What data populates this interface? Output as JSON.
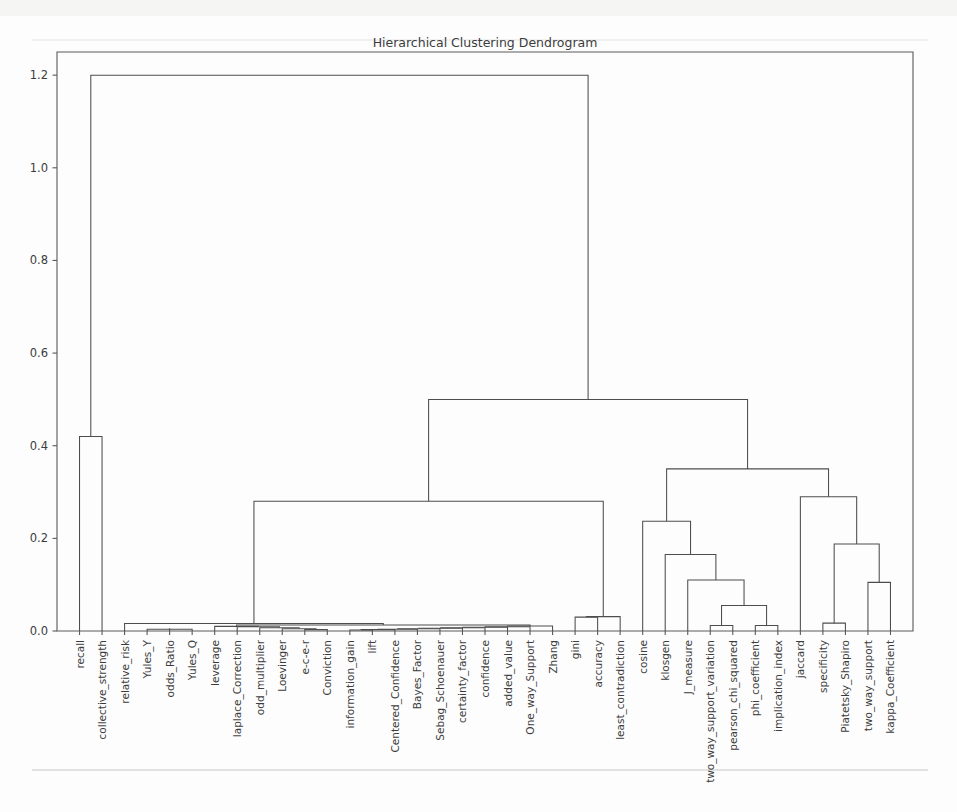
{
  "figure": {
    "title": "Hierarchical Clustering Dendrogram",
    "width": 957,
    "height": 812,
    "background_color": "#fdfdfd",
    "line_color": "#4d4d4d",
    "axis_color": "#5a5a5a",
    "text_color": "#3c3c3c"
  },
  "axes": {
    "left_px": 57,
    "right_px": 913,
    "top_px": 52,
    "bottom_px": 631,
    "y_label": "",
    "x_label": "",
    "grid": false,
    "y_ticks": [
      "0.0",
      "0.2",
      "0.4",
      "0.6",
      "0.8",
      "1.0",
      "1.2"
    ],
    "y_tick_values": [
      0.0,
      0.2,
      0.4,
      0.6,
      0.8,
      1.0,
      1.2
    ]
  },
  "chart_data": {
    "type": "dendrogram",
    "title": "Hierarchical Clustering Dendrogram",
    "xlabel": "",
    "ylabel": "",
    "ylim": [
      0.0,
      1.25
    ],
    "grid": false,
    "legend": "none",
    "orientation": "top",
    "leaf_labels": [
      "recall",
      "collective_strength",
      "relative_risk",
      "Yules_Y",
      "odds_Ratio",
      "Yules_Q",
      "leverage",
      "laplace_Correction",
      "odd_multiplier",
      "Loevinger",
      "e-c-e-r",
      "Conviction",
      "information_gain",
      "lift",
      "Centered_Confidence",
      "Bayes_Factor",
      "Sebag_Schoenauer",
      "certainty_factor",
      "confidence",
      "added_value",
      "One_way_Support",
      "Zhang",
      "gini",
      "accuracy",
      "least_contradiction",
      "cosine",
      "klosgen",
      "J_measure",
      "two_way_support_variation",
      "pearson_chi_squared",
      "phi_coefficient",
      "implication_index",
      "jaccard",
      "specificity",
      "Piatetsky_Shapiro",
      "two_way_support",
      "kappa_Coefficient"
    ],
    "leaf_count": 37,
    "merges": [
      {
        "id": 37,
        "left": 3,
        "right": 5,
        "height": 0.004,
        "note": "Yules_Y + Yules_Q"
      },
      {
        "id": 38,
        "left": 4,
        "right": 37,
        "height": 0.006,
        "note": "odds_Ratio + (Yules_Y,Yules_Q)"
      },
      {
        "id": 39,
        "left": 10,
        "right": 11,
        "height": 0.003,
        "note": "e-c-e-r + Conviction"
      },
      {
        "id": 40,
        "left": 9,
        "right": 39,
        "height": 0.005,
        "note": "Loevinger + (e-c-e-r,Conviction)"
      },
      {
        "id": 41,
        "left": 8,
        "right": 40,
        "height": 0.007,
        "note": "odd_multiplier + cluster"
      },
      {
        "id": 42,
        "left": 7,
        "right": 41,
        "height": 0.009,
        "note": "laplace_Correction + cluster"
      },
      {
        "id": 43,
        "left": 6,
        "right": 42,
        "height": 0.01,
        "note": "leverage + cluster"
      },
      {
        "id": 44,
        "left": 12,
        "right": 13,
        "height": 0.002,
        "note": "information_gain + lift"
      },
      {
        "id": 45,
        "left": 14,
        "right": 44,
        "height": 0.003,
        "note": "Centered_Confidence + cluster"
      },
      {
        "id": 46,
        "left": 15,
        "right": 45,
        "height": 0.004,
        "note": "Bayes_Factor + cluster"
      },
      {
        "id": 47,
        "left": 16,
        "right": 46,
        "height": 0.005,
        "note": "Sebag_Schoenauer + cluster"
      },
      {
        "id": 48,
        "left": 17,
        "right": 47,
        "height": 0.006,
        "note": "certainty_factor + cluster"
      },
      {
        "id": 49,
        "left": 18,
        "right": 48,
        "height": 0.007,
        "note": "confidence + cluster"
      },
      {
        "id": 50,
        "left": 19,
        "right": 49,
        "height": 0.008,
        "note": "added_value + cluster"
      },
      {
        "id": 51,
        "left": 20,
        "right": 50,
        "height": 0.009,
        "note": "One_way_Support + cluster"
      },
      {
        "id": 52,
        "left": 21,
        "right": 51,
        "height": 0.011,
        "note": "Zhang + cluster"
      },
      {
        "id": 53,
        "left": 43,
        "right": 52,
        "height": 0.013,
        "note": "merge mid clusters"
      },
      {
        "id": 54,
        "left": 2,
        "right": 53,
        "height": 0.016,
        "note": "relative_risk + big low cluster"
      },
      {
        "id": 55,
        "left": 22,
        "right": 23,
        "height": 0.03,
        "note": "gini + accuracy"
      },
      {
        "id": 56,
        "left": 24,
        "right": 55,
        "height": 0.031,
        "note": "least_contradiction + (gini,accuracy)"
      },
      {
        "id": 57,
        "left": 54,
        "right": 56,
        "height": 0.28,
        "note": "left major cluster"
      },
      {
        "id": 58,
        "left": 0,
        "right": 1,
        "height": 0.42,
        "note": "recall + collective_strength"
      },
      {
        "id": 59,
        "left": 28,
        "right": 29,
        "height": 0.012,
        "note": "two_way_support_variation + pearson_chi_squared"
      },
      {
        "id": 60,
        "left": 30,
        "right": 31,
        "height": 0.012,
        "note": "phi_coefficient + implication_index"
      },
      {
        "id": 61,
        "left": 59,
        "right": 60,
        "height": 0.055,
        "note": "chi cluster"
      },
      {
        "id": 62,
        "left": 27,
        "right": 61,
        "height": 0.11,
        "note": "J_measure + chi cluster"
      },
      {
        "id": 63,
        "left": 26,
        "right": 62,
        "height": 0.165,
        "note": "klosgen + cluster"
      },
      {
        "id": 64,
        "left": 25,
        "right": 63,
        "height": 0.237,
        "note": "cosine + cluster"
      },
      {
        "id": 65,
        "left": 33,
        "right": 34,
        "height": 0.017,
        "note": "specificity + Piatetsky_Shapiro"
      },
      {
        "id": 66,
        "left": 35,
        "right": 36,
        "height": 0.105,
        "note": "two_way_support + kappa_Coefficient"
      },
      {
        "id": 67,
        "left": 65,
        "right": 66,
        "height": 0.188,
        "note": "specificity cluster + kappa cluster"
      },
      {
        "id": 68,
        "left": 32,
        "right": 67,
        "height": 0.29,
        "note": "jaccard + cluster"
      },
      {
        "id": 69,
        "left": 64,
        "right": 68,
        "height": 0.35,
        "note": "right major cluster"
      },
      {
        "id": 70,
        "left": 57,
        "right": 69,
        "height": 0.5,
        "note": "combine left+right majors"
      },
      {
        "id": 71,
        "left": 58,
        "right": 70,
        "height": 1.2,
        "note": "root"
      }
    ]
  }
}
